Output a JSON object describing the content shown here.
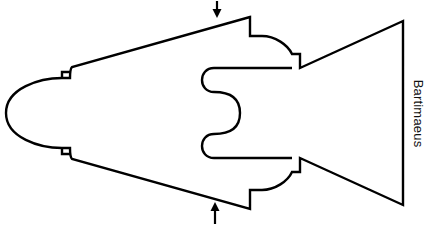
{
  "figure": {
    "title": "Bartimaeus",
    "caption_rotation_deg": 90,
    "background_color": "#ffffff",
    "stroke_color": "#000000",
    "stroke_width": 2.2,
    "fill_color": "none",
    "shape_name": "fish-puzzle-piece-outline",
    "annotations": [
      {
        "name": "top-arrow",
        "direction": "down",
        "label": "",
        "x": 217,
        "y_start": 1,
        "y_end": 17
      },
      {
        "name": "bottom-arrow",
        "direction": "up",
        "label": "",
        "x": 215,
        "y_start": 223,
        "y_end": 203
      }
    ],
    "parts": [
      {
        "name": "nose",
        "position": "left"
      },
      {
        "name": "upper-wing",
        "position": "top-left"
      },
      {
        "name": "lower-wing",
        "position": "bottom-left"
      },
      {
        "name": "serpentine-notch",
        "position": "center"
      },
      {
        "name": "tail-fin",
        "position": "right"
      }
    ]
  }
}
